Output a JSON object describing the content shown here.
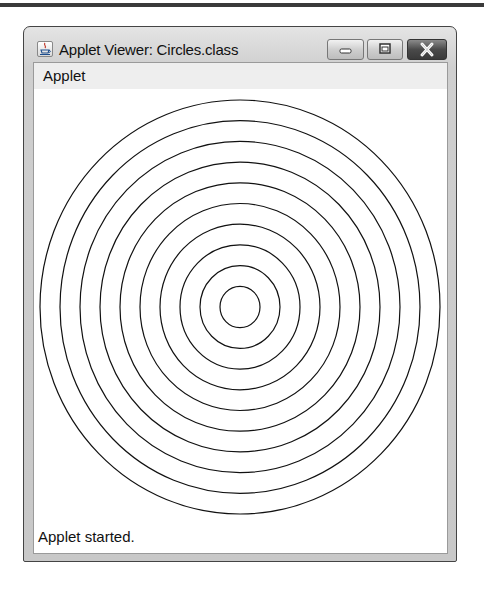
{
  "window": {
    "title": "Applet Viewer: Circles.class",
    "controls": {
      "minimize": "minimize-icon",
      "maximize": "maximize-icon",
      "close": "close-icon"
    },
    "app_icon": "java-cup-icon"
  },
  "menubar": {
    "items": [
      {
        "label": "Applet"
      }
    ]
  },
  "applet": {
    "drawing": "concentric-circles",
    "circle_count": 10,
    "center": [
      240,
      307
    ],
    "radius_step": 20,
    "stroke_color": "#111111",
    "background_color": "#ffffff"
  },
  "status": {
    "text": "Applet started."
  }
}
